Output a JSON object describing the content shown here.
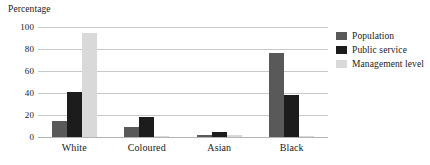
{
  "chart_data": {
    "type": "bar",
    "title": "",
    "ylabel": "Percentage",
    "xlabel": "",
    "categories": [
      "White",
      "Coloured",
      "Asian",
      "Black"
    ],
    "series": [
      {
        "name": "Population",
        "color": "#595959",
        "values": [
          15,
          9,
          2,
          76
        ]
      },
      {
        "name": "Public service",
        "color": "#1c1c1c",
        "values": [
          41,
          18,
          5,
          38
        ]
      },
      {
        "name": "Management level",
        "color": "#d9d9d9",
        "values": [
          95,
          1,
          2,
          1
        ]
      }
    ],
    "ylim": [
      0,
      100
    ],
    "yticks": [
      100,
      80,
      60,
      40,
      20,
      0
    ],
    "ytick_labels": [
      "100",
      "80",
      "60",
      "40",
      "20",
      "0"
    ],
    "grid": true,
    "legend_position": "right"
  },
  "legend": {
    "items": [
      {
        "label": "Population"
      },
      {
        "label": "Public service"
      },
      {
        "label": "Management level"
      }
    ]
  }
}
